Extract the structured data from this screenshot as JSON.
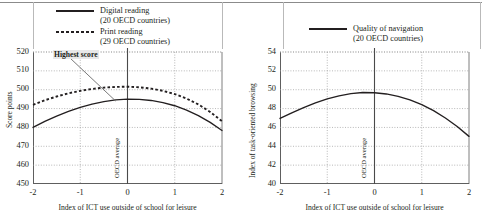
{
  "figure": {
    "panels": [
      {
        "id": "left",
        "legend": [
          {
            "style": "solid",
            "label": "Digital reading",
            "sublabel": "(20 OECD countries)"
          },
          {
            "style": "dotted",
            "label": "Print reading",
            "sublabel": "(29 OECD countries)"
          }
        ],
        "annotation": {
          "text": "Highest score"
        },
        "vline_label": "OECD average"
      },
      {
        "id": "right",
        "legend": [
          {
            "style": "solid",
            "label": "Quality of navigation",
            "sublabel": "(20 OECD countries)"
          }
        ],
        "vline_label": "OECD average"
      }
    ]
  },
  "chart_data": [
    {
      "type": "line",
      "title": "",
      "xlabel": "Index of ICT use outside of school for leisure",
      "ylabel": "Score points",
      "xlim": [
        -2,
        2
      ],
      "ylim": [
        450,
        520
      ],
      "xticks": [
        -2,
        -1,
        0,
        1,
        2
      ],
      "xticklabels": [
        "-2",
        "-1",
        "0",
        "1",
        "2"
      ],
      "yticks": [
        450,
        460,
        470,
        480,
        490,
        500,
        510,
        520
      ],
      "yticklabels": [
        "450",
        "460",
        "470",
        "480",
        "490",
        "500",
        "510",
        "520"
      ],
      "grid": true,
      "legend_position": "above-left",
      "annotations": [
        {
          "text": "Highest score",
          "points_to_series": "Digital reading",
          "at_x": -0.25,
          "at_y": 494
        }
      ],
      "reference_line": {
        "x": 0,
        "label": "OECD average"
      },
      "x": [
        -2.0,
        -1.75,
        -1.5,
        -1.25,
        -1.0,
        -0.75,
        -0.5,
        -0.25,
        0.0,
        0.25,
        0.5,
        0.75,
        1.0,
        1.25,
        1.5,
        1.75,
        2.0
      ],
      "series": [
        {
          "name": "Digital reading",
          "style": "solid",
          "values": [
            480.0,
            483.2,
            486.0,
            488.5,
            490.6,
            492.4,
            493.7,
            494.6,
            495.0,
            494.9,
            494.3,
            493.2,
            491.5,
            489.2,
            486.3,
            482.7,
            478.4
          ]
        },
        {
          "name": "Print reading",
          "style": "dotted",
          "values": [
            492.0,
            494.4,
            496.4,
            498.1,
            499.4,
            500.4,
            501.1,
            501.5,
            501.6,
            501.3,
            500.6,
            499.4,
            497.7,
            495.3,
            492.2,
            488.2,
            483.3
          ]
        }
      ]
    },
    {
      "type": "line",
      "title": "",
      "xlabel": "Index of ICT use outside of school for leisure",
      "ylabel": "Index of task-oriented browsing",
      "xlim": [
        -2,
        2
      ],
      "ylim": [
        40,
        54
      ],
      "xticks": [
        -2,
        -1,
        0,
        1,
        2
      ],
      "xticklabels": [
        "-2",
        "-1",
        "0",
        "1",
        "2"
      ],
      "yticks": [
        40,
        42,
        44,
        46,
        48,
        50,
        52,
        54
      ],
      "yticklabels": [
        "40",
        "42",
        "44",
        "46",
        "48",
        "50",
        "52",
        "54"
      ],
      "grid": true,
      "legend_position": "above-center",
      "reference_line": {
        "x": 0,
        "label": "OECD average"
      },
      "x": [
        -2.0,
        -1.75,
        -1.5,
        -1.25,
        -1.0,
        -0.75,
        -0.5,
        -0.25,
        0.0,
        0.25,
        0.5,
        0.75,
        1.0,
        1.25,
        1.5,
        1.75,
        2.0
      ],
      "series": [
        {
          "name": "Quality of navigation",
          "style": "solid",
          "values": [
            46.95,
            47.55,
            48.1,
            48.6,
            49.02,
            49.35,
            49.58,
            49.7,
            49.68,
            49.55,
            49.3,
            48.92,
            48.42,
            47.78,
            47.0,
            46.1,
            45.05
          ]
        }
      ]
    }
  ]
}
